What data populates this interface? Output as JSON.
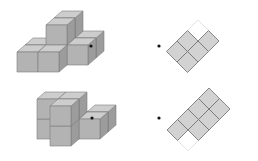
{
  "colors": {
    "background": "#ffffff",
    "cube_top": "#cdcdcd",
    "cube_front": "#b3b3b3",
    "cube_side": "#9c9c9c",
    "cube_edge": "#7d7d7d",
    "tile_fill": "#d2d2d2",
    "tile_stroke": "#6f6f6f",
    "tile_outline": "#dcdcdc",
    "dot": "#111111"
  },
  "projection": {
    "front_w": 21,
    "front_h": 20,
    "depth_dx": 8,
    "depth_dy": -7
  },
  "rows": [
    {
      "name": "row-1",
      "solid": {
        "origin": [
          17,
          72
        ],
        "voxels": [
          [
            0,
            0,
            1
          ],
          [
            1,
            0,
            1
          ],
          [
            2,
            0,
            1
          ],
          [
            2,
            0,
            2
          ],
          [
            0,
            0,
            0
          ],
          [
            1,
            0,
            0
          ],
          [
            1,
            1,
            2
          ],
          [
            1,
            1,
            1
          ]
        ]
      },
      "dots": [
        [
          91,
          46
        ],
        [
          159,
          46
        ]
      ],
      "plan": {
        "origin": [
          198,
          20
        ],
        "half_diag": 10.5,
        "filled": [
          [
            0,
            1
          ],
          [
            1,
            0
          ],
          [
            0,
            2
          ],
          [
            1,
            1
          ],
          [
            1,
            2
          ]
        ],
        "outlined": [
          [
            0,
            0
          ]
        ]
      }
    },
    {
      "name": "row-2",
      "solid": {
        "origin": [
          29,
          146
        ],
        "voxels": [
          [
            0,
            0,
            1
          ],
          [
            0,
            1,
            1
          ],
          [
            2,
            0,
            2
          ],
          [
            2,
            0,
            1
          ],
          [
            1,
            0,
            1
          ],
          [
            1,
            1,
            1
          ],
          [
            1,
            0,
            0
          ],
          [
            1,
            1,
            0
          ]
        ]
      },
      "dots": [
        [
          92,
          118
        ],
        [
          159,
          118
        ]
      ],
      "plan": {
        "origin": [
          209,
          88
        ],
        "half_diag": 10.5,
        "filled": [
          [
            0,
            0
          ],
          [
            1,
            0
          ],
          [
            0,
            1
          ],
          [
            1,
            1
          ],
          [
            0,
            2
          ],
          [
            1,
            2
          ],
          [
            0,
            3
          ]
        ],
        "outlined": [
          [
            1,
            3
          ]
        ]
      }
    }
  ]
}
